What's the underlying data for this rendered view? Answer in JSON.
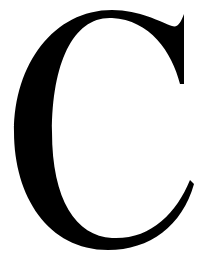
{
  "glyph": {
    "character": "C",
    "color": "#000000",
    "background": "#ffffff"
  }
}
